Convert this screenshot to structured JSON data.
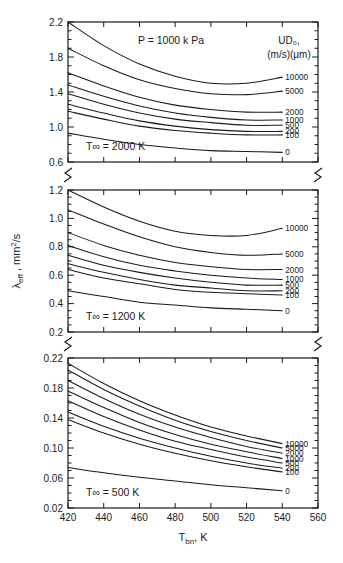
{
  "chart_data": {
    "type": "line",
    "title": "P = 1000 k Pa",
    "xlabel": "T_bn, K",
    "ylabel": "λ_eff , mm²/s",
    "xlim": [
      420,
      560
    ],
    "xticks": [
      420,
      440,
      460,
      480,
      500,
      520,
      540,
      560
    ],
    "xtick_labels": [
      "420",
      "440",
      "460",
      "480",
      "500",
      "520",
      "540",
      "560"
    ],
    "grid": false,
    "legend_position": "right-inline-end-of-curve",
    "legend_title_line1": "UD₀,",
    "legend_title_line2": "(m/s)(μm)",
    "series_names": [
      "10000",
      "5000",
      "2000",
      "1000",
      "500",
      "200",
      "100",
      "0"
    ],
    "panels": [
      {
        "annotation": "T∞ = 2000 K",
        "ylim": [
          0.6,
          2.2
        ],
        "yticks": [
          0.6,
          1.0,
          1.4,
          1.8,
          2.2
        ],
        "ytick_labels": [
          "0.6",
          "1.0",
          "1.4",
          "1.8",
          "2.2"
        ],
        "yminor_step": 0.1,
        "x": [
          420,
          440,
          460,
          480,
          500,
          520,
          540
        ],
        "series": [
          {
            "name": "10000",
            "values": [
              2.2,
              1.93,
              1.72,
              1.58,
              1.5,
              1.5,
              1.57
            ]
          },
          {
            "name": "5000",
            "values": [
              1.9,
              1.7,
              1.54,
              1.44,
              1.38,
              1.37,
              1.41
            ]
          },
          {
            "name": "2000",
            "values": [
              1.62,
              1.47,
              1.34,
              1.25,
              1.2,
              1.17,
              1.17
            ]
          },
          {
            "name": "1000",
            "values": [
              1.48,
              1.35,
              1.24,
              1.16,
              1.11,
              1.08,
              1.08
            ]
          },
          {
            "name": "500",
            "values": [
              1.38,
              1.26,
              1.16,
              1.09,
              1.05,
              1.02,
              1.02
            ]
          },
          {
            "name": "200",
            "values": [
              1.26,
              1.16,
              1.07,
              1.01,
              0.97,
              0.95,
              0.95
            ]
          },
          {
            "name": "100",
            "values": [
              1.18,
              1.09,
              1.01,
              0.96,
              0.93,
              0.91,
              0.91
            ]
          },
          {
            "name": "0",
            "values": [
              0.93,
              0.86,
              0.8,
              0.76,
              0.73,
              0.72,
              0.71
            ]
          }
        ]
      },
      {
        "annotation": "T∞ = 1200 K",
        "ylim": [
          0.2,
          1.2
        ],
        "yticks": [
          0.2,
          0.4,
          0.6,
          0.8,
          1.0,
          1.2
        ],
        "ytick_labels": [
          "0.2",
          "0.4",
          "0.6",
          "0.8",
          "1.0",
          "1.2"
        ],
        "yminor_step": 0.05,
        "x": [
          420,
          440,
          460,
          480,
          500,
          520,
          540
        ],
        "series": [
          {
            "name": "10000",
            "values": [
              1.2,
              1.08,
              0.98,
              0.91,
              0.88,
              0.88,
              0.93
            ]
          },
          {
            "name": "5000",
            "values": [
              1.06,
              0.96,
              0.87,
              0.8,
              0.76,
              0.74,
              0.75
            ]
          },
          {
            "name": "2000",
            "values": [
              0.9,
              0.81,
              0.74,
              0.69,
              0.66,
              0.64,
              0.64
            ]
          },
          {
            "name": "1000",
            "values": [
              0.81,
              0.73,
              0.67,
              0.63,
              0.6,
              0.58,
              0.57
            ]
          },
          {
            "name": "500",
            "values": [
              0.74,
              0.67,
              0.62,
              0.58,
              0.55,
              0.53,
              0.53
            ]
          },
          {
            "name": "200",
            "values": [
              0.68,
              0.62,
              0.57,
              0.53,
              0.51,
              0.49,
              0.49
            ]
          },
          {
            "name": "100",
            "values": [
              0.64,
              0.58,
              0.54,
              0.5,
              0.48,
              0.47,
              0.46
            ]
          },
          {
            "name": "0",
            "values": [
              0.49,
              0.45,
              0.41,
              0.39,
              0.37,
              0.36,
              0.35
            ]
          }
        ]
      },
      {
        "annotation": "T∞ = 500 K",
        "ylim": [
          0.02,
          0.22
        ],
        "yticks": [
          0.02,
          0.06,
          0.1,
          0.14,
          0.18,
          0.22
        ],
        "ytick_labels": [
          "0.02",
          "0.06",
          "0.10",
          "0.14",
          "0.18",
          "0.22"
        ],
        "yminor_step": 0.01,
        "x": [
          420,
          440,
          460,
          480,
          500,
          520,
          540
        ],
        "series": [
          {
            "name": "10000",
            "values": [
              0.213,
              0.186,
              0.163,
              0.144,
              0.128,
              0.116,
              0.106
            ]
          },
          {
            "name": "5000",
            "values": [
              0.204,
              0.178,
              0.156,
              0.137,
              0.122,
              0.11,
              0.1
            ]
          },
          {
            "name": "2000",
            "values": [
              0.19,
              0.166,
              0.145,
              0.128,
              0.114,
              0.102,
              0.093
            ]
          },
          {
            "name": "1000",
            "values": [
              0.176,
              0.154,
              0.134,
              0.118,
              0.105,
              0.095,
              0.086
            ]
          },
          {
            "name": "500",
            "values": [
              0.163,
              0.142,
              0.124,
              0.109,
              0.098,
              0.088,
              0.08
            ]
          },
          {
            "name": "200",
            "values": [
              0.148,
              0.129,
              0.113,
              0.1,
              0.089,
              0.08,
              0.073
            ]
          },
          {
            "name": "100",
            "values": [
              0.138,
              0.12,
              0.105,
              0.093,
              0.083,
              0.075,
              0.068
            ]
          },
          {
            "name": "0",
            "values": [
              0.074,
              0.067,
              0.061,
              0.056,
              0.051,
              0.047,
              0.043
            ]
          }
        ]
      }
    ]
  }
}
